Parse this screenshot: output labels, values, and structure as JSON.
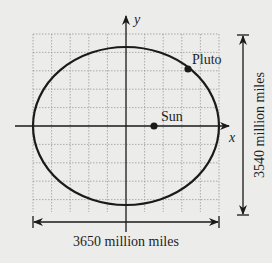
{
  "diagram": {
    "type": "ellipse-orbit",
    "axes": {
      "x_label": "x",
      "y_label": "y"
    },
    "ellipse": {
      "cx": 126,
      "cy": 126,
      "rx": 93,
      "ry": 79,
      "stroke": "#1a1a1a"
    },
    "points": [
      {
        "name": "Sun",
        "label": "Sun",
        "x": 154,
        "y": 126
      },
      {
        "name": "Pluto",
        "label": "Pluto",
        "x": 188,
        "y": 69
      }
    ],
    "dimensions": {
      "horizontal": {
        "label": "3650 million miles"
      },
      "vertical": {
        "label": "3540 million miles"
      }
    },
    "colors": {
      "background": "#ececea",
      "ink": "#1a1a1a",
      "grid": "#9a9a9a"
    }
  }
}
